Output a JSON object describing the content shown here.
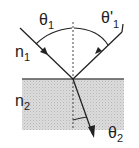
{
  "diagram": {
    "labels": {
      "theta1": "θ",
      "theta1_sub": "1",
      "theta1_reflected": "θ'",
      "theta1_reflected_sub": "1",
      "n1": "n",
      "n1_sub": "1",
      "n2": "n",
      "n2_sub": "2",
      "theta2": "θ",
      "theta2_sub": "2"
    },
    "colors": {
      "line": "#222222",
      "medium2_fill": "#d6d6d6",
      "normal_dashed": "#444444"
    }
  }
}
